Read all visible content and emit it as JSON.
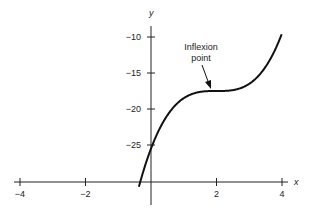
{
  "chart_data": {
    "type": "line",
    "title": "",
    "xlabel": "x",
    "ylabel": "y",
    "xlim": [
      -4.1,
      4.3
    ],
    "ylim": [
      -31.5,
      -6
    ],
    "x_ticks": [
      -4,
      -2,
      2,
      4
    ],
    "x_tick_labels": [
      "−4",
      "−2",
      "2",
      "4"
    ],
    "y_ticks": [
      -10,
      -15,
      -20,
      -25
    ],
    "y_tick_labels": [
      "−10",
      "−15",
      "−20",
      "−25"
    ],
    "grid": false,
    "series": [
      {
        "name": "y = (x − 2)^3 − 17.5",
        "x": [
          -0.35,
          0,
          0.5,
          1,
          1.5,
          2,
          2.5,
          3,
          3.5,
          4
        ],
        "values": [
          -30.5,
          -25.5,
          -20.9,
          -18.5,
          -17.6,
          -17.5,
          -17.4,
          -16.5,
          -14.1,
          -9.5
        ]
      }
    ],
    "annotations": [
      {
        "text": "Inflexion\npoint",
        "x": 2,
        "y": -17.5,
        "arrow": true
      }
    ]
  },
  "labels": {
    "x_axis": "x",
    "y_axis": "y",
    "annotation_line1": "Inflexion",
    "annotation_line2": "point"
  }
}
